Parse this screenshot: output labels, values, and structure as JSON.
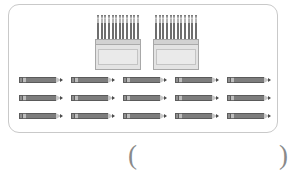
{
  "worksheet": {
    "panel_label": "pencil-quantity-illustration",
    "boxes": [
      {
        "id": "pencil-box-1",
        "pencils_per_box": 12,
        "front_color": "#e3e3e3",
        "pencil_color": "#6e6e6e"
      },
      {
        "id": "pencil-box-2",
        "pencils_per_box": 12,
        "front_color": "#e3e3e3",
        "pencil_color": "#6e6e6e"
      }
    ],
    "loose_pencils": {
      "rows": 3,
      "columns": 5,
      "total": 15,
      "body_color": "#7d7d7d",
      "eraser_color": "#8f8f8f",
      "lead_color": "#4a4a4a"
    },
    "answer": {
      "paren_open": "(",
      "paren_close": ")",
      "value": ""
    },
    "colors": {
      "panel_border": "#c9c9c9",
      "background": "#ffffff",
      "text": "#8a8a8a"
    }
  },
  "chart_data": {
    "type": "table",
    "title": "",
    "categories": [
      "Boxes of pencils",
      "Loose pencils"
    ],
    "values": [
      2,
      15
    ],
    "annotations": [
      "Each box contains 12 pencils"
    ]
  }
}
